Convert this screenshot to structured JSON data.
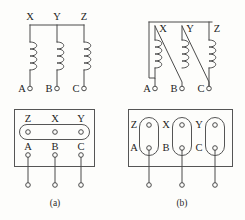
{
  "figure": {
    "captions": {
      "a": "(a)",
      "b": "(b)"
    }
  },
  "panels": {
    "top_left": {
      "name": "star-wye-winding-schematic",
      "description": "Three coils with tops joined by a common horizontal bus (star point), bottoms going to line terminals",
      "top_labels": [
        "X",
        "Y",
        "Z"
      ],
      "bottom_labels": [
        "A",
        "B",
        "C"
      ],
      "coil_count": 3,
      "coil_turns": 4,
      "bus": "horizontal"
    },
    "top_right": {
      "name": "delta-winding-schematic",
      "description": "Three coils connected in delta; each coil top joins by a diagonal lead to the next phase terminal",
      "top_labels": [
        "X",
        "Y",
        "Z"
      ],
      "bottom_labels": [
        "A",
        "B",
        "C"
      ],
      "coil_count": 3,
      "coil_turns": 4,
      "bus": "diagonal"
    },
    "bottom_left": {
      "name": "terminal-board-star-links",
      "description": "Terminal board with one horizontal link bar shorting the three upper studs",
      "top_labels": [
        "Z",
        "X",
        "Y"
      ],
      "bottom_labels": [
        "A",
        "B",
        "C"
      ],
      "link_orientation": "horizontal",
      "link_count": 1,
      "studs_per_link": 3,
      "outgoing_leads": 3,
      "caption": "(a)"
    },
    "bottom_right": {
      "name": "terminal-board-delta-links",
      "description": "Terminal board with three vertical link bars, each shorting one upper stud to the lower stud of the adjacent phase",
      "pairs": [
        {
          "top": "Z",
          "bottom": "A"
        },
        {
          "top": "X",
          "bottom": "B"
        },
        {
          "top": "Y",
          "bottom": "C"
        }
      ],
      "link_orientation": "vertical",
      "link_count": 3,
      "studs_per_link": 2,
      "outgoing_leads": 3,
      "caption": "(b)"
    }
  },
  "colors": {
    "background": "#fdfdfb",
    "line": "#4b4b4b",
    "box_line": "#555555",
    "text": "#1d1d1d"
  }
}
